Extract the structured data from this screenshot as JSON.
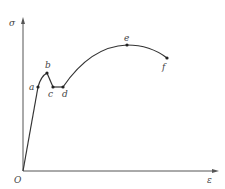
{
  "diagram": {
    "axes": {
      "y_label": "σ",
      "x_label": "ε",
      "origin_label": "O"
    },
    "points": [
      {
        "id": "a",
        "label": "a"
      },
      {
        "id": "b",
        "label": "b"
      },
      {
        "id": "c",
        "label": "c"
      },
      {
        "id": "d",
        "label": "d"
      },
      {
        "id": "e",
        "label": "e"
      },
      {
        "id": "f",
        "label": "f"
      }
    ],
    "colors": {
      "line": "#333333",
      "axis": "#555555",
      "label": "#444444"
    }
  }
}
